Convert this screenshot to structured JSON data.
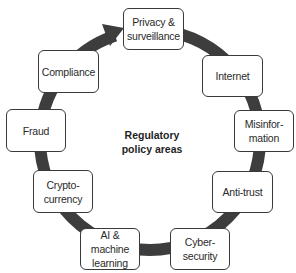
{
  "diagram": {
    "type": "cycle",
    "center_label": "Regulatory\npolicy areas",
    "direction": "clockwise",
    "colors": {
      "ring": "#3d3d3d",
      "box_border": "#3a3a3a",
      "box_fill": "#ffffff",
      "text": "#2a2a2a"
    },
    "nodes": [
      {
        "id": "privacy",
        "label": "Privacy &\nsurveillance",
        "x": 123,
        "y": 8,
        "w": 61,
        "h": 42
      },
      {
        "id": "internet",
        "label": "Internet",
        "x": 202,
        "y": 55,
        "w": 61,
        "h": 42
      },
      {
        "id": "misinformation",
        "label": "Misinfor-\nmation",
        "x": 234,
        "y": 110,
        "w": 60,
        "h": 42
      },
      {
        "id": "anti-trust",
        "label": "Anti-trust",
        "x": 212,
        "y": 171,
        "w": 61,
        "h": 42
      },
      {
        "id": "cybersecurity",
        "label": "Cyber-\nsecurity",
        "x": 170,
        "y": 228,
        "w": 60,
        "h": 42
      },
      {
        "id": "ai",
        "label": "AI &\nmachine\nlearning",
        "x": 80,
        "y": 228,
        "w": 60,
        "h": 42
      },
      {
        "id": "cryptocurrency",
        "label": "Crypto-\ncurrency",
        "x": 33,
        "y": 170,
        "w": 60,
        "h": 43
      },
      {
        "id": "fraud",
        "label": "Fraud",
        "x": 6,
        "y": 109,
        "w": 60,
        "h": 43
      },
      {
        "id": "compliance",
        "label": "Compliance",
        "x": 38,
        "y": 50,
        "w": 61,
        "h": 43
      }
    ]
  }
}
